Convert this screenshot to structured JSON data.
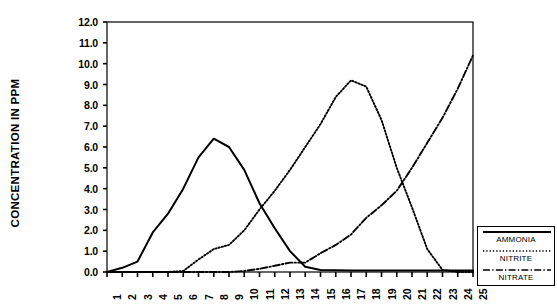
{
  "chart_data": {
    "type": "line",
    "title": "",
    "xlabel": "",
    "ylabel": "CONCENTRATION IN PPM",
    "xlim": [
      1,
      25
    ],
    "ylim": [
      0.0,
      12.0
    ],
    "grid": false,
    "legend_position": "right",
    "x": [
      1,
      2,
      3,
      4,
      5,
      6,
      7,
      8,
      9,
      10,
      11,
      12,
      13,
      14,
      15,
      16,
      17,
      18,
      19,
      20,
      21,
      22,
      23,
      24,
      25
    ],
    "xtick_labels": [
      "1",
      "2",
      "3",
      "4",
      "5",
      "6",
      "7",
      "8",
      "9",
      "10",
      "11",
      "12",
      "13",
      "14",
      "15",
      "16",
      "17",
      "18",
      "19",
      "20",
      "21",
      "22",
      "23",
      "24",
      "25"
    ],
    "ytick_labels": [
      "0.0",
      "1.0",
      "2.0",
      "3.0",
      "4.0",
      "5.0",
      "6.0",
      "7.0",
      "8.0",
      "9.0",
      "10.0",
      "11.0",
      "12.0"
    ],
    "ytick_values": [
      0.0,
      1.0,
      2.0,
      3.0,
      4.0,
      5.0,
      6.0,
      7.0,
      8.0,
      9.0,
      10.0,
      11.0,
      12.0
    ],
    "series": [
      {
        "name": "AMMONIA",
        "style": "solid",
        "color": "#000000",
        "values": [
          0.0,
          0.2,
          0.5,
          1.9,
          2.8,
          4.0,
          5.5,
          6.4,
          6.0,
          4.9,
          3.3,
          2.1,
          1.0,
          0.25,
          0.1,
          0.08,
          0.07,
          0.07,
          0.07,
          0.07,
          0.07,
          0.07,
          0.07,
          0.07,
          0.07
        ]
      },
      {
        "name": "NITRITE",
        "style": "dotted",
        "color": "#000000",
        "values": [
          0.0,
          0.0,
          0.0,
          0.0,
          0.0,
          0.05,
          0.6,
          1.1,
          1.3,
          2.0,
          3.0,
          3.9,
          4.9,
          6.0,
          7.1,
          8.4,
          9.2,
          8.9,
          7.3,
          5.0,
          3.1,
          1.1,
          0.1,
          0.0,
          0.0
        ]
      },
      {
        "name": "NITRATE",
        "style": "dashdot",
        "color": "#000000",
        "values": [
          0.0,
          0.0,
          0.0,
          0.0,
          0.0,
          0.0,
          0.0,
          0.0,
          0.0,
          0.05,
          0.15,
          0.3,
          0.45,
          0.45,
          0.9,
          1.3,
          1.8,
          2.6,
          3.2,
          3.9,
          5.0,
          6.2,
          7.4,
          8.8,
          10.4
        ]
      }
    ]
  },
  "legend": {
    "entries": [
      {
        "label": "AMMONIA",
        "style": "solid"
      },
      {
        "label": "NITRITE",
        "style": "dotted"
      },
      {
        "label": "NITRATE",
        "style": "dashdot"
      }
    ]
  }
}
